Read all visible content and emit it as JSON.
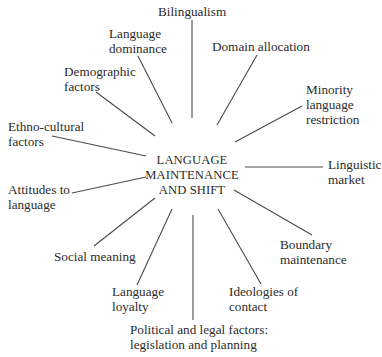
{
  "diagram": {
    "center": {
      "lines": [
        "LANGUAGE",
        "MAINTENANCE",
        "AND SHIFT"
      ]
    },
    "factors": [
      {
        "id": "bilingualism",
        "lines": [
          "Bilingualism"
        ]
      },
      {
        "id": "language-dominance",
        "lines": [
          "Language",
          "dominance"
        ]
      },
      {
        "id": "domain-allocation",
        "lines": [
          "Domain allocation"
        ]
      },
      {
        "id": "demographic-factors",
        "lines": [
          "Demographic",
          "factors"
        ]
      },
      {
        "id": "minority-language-restriction",
        "lines": [
          "Minority",
          "language",
          "restriction"
        ]
      },
      {
        "id": "ethno-cultural-factors",
        "lines": [
          "Ethno-cultural",
          "factors"
        ]
      },
      {
        "id": "linguistic-market",
        "lines": [
          "Linguistic",
          "market"
        ]
      },
      {
        "id": "attitudes-to-language",
        "lines": [
          "Attitudes to",
          "language"
        ]
      },
      {
        "id": "boundary-maintenance",
        "lines": [
          "Boundary",
          "maintenance"
        ]
      },
      {
        "id": "social-meaning",
        "lines": [
          "Social meaning"
        ]
      },
      {
        "id": "ideologies-of-contact",
        "lines": [
          "Ideologies of",
          "contact"
        ]
      },
      {
        "id": "language-loyalty",
        "lines": [
          "Language",
          "loyalty"
        ]
      },
      {
        "id": "political-legal-factors",
        "lines": [
          "Political and legal factors:",
          "legislation and planning"
        ]
      }
    ],
    "colors": {
      "background": "#ffffff",
      "text": "#2b2b2b",
      "connector": "#4a4a4a"
    }
  }
}
